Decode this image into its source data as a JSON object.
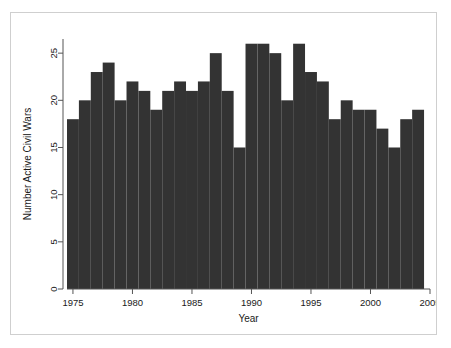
{
  "chart_data": {
    "type": "bar",
    "title": "",
    "subtitle": "",
    "xlabel": "Year",
    "ylabel": "Number Active Civil Wars",
    "categories": [
      1975,
      1976,
      1977,
      1978,
      1979,
      1980,
      1981,
      1982,
      1983,
      1984,
      1985,
      1986,
      1987,
      1988,
      1989,
      1990,
      1991,
      1992,
      1993,
      1994,
      1995,
      1996,
      1997,
      1998,
      1999,
      2000,
      2001,
      2002,
      2003,
      2004
    ],
    "values": [
      18,
      20,
      23,
      24,
      20,
      22,
      21,
      19,
      21,
      22,
      21,
      22,
      25,
      21,
      15,
      26,
      26,
      25,
      20,
      26,
      23,
      22,
      18,
      20,
      19,
      19,
      17,
      15,
      18,
      19
    ],
    "xlim": [
      1974.5,
      2005.0
    ],
    "ylim": [
      0,
      26.5
    ],
    "xticks": [
      1975,
      1980,
      1985,
      1990,
      1995,
      2000,
      2005
    ],
    "xtick_labels": [
      "1975",
      "1980",
      "1985",
      "1990",
      "1995",
      "2000",
      "2005"
    ],
    "yticks": [
      0,
      5,
      10,
      15,
      20,
      25
    ],
    "ytick_labels": [
      "0",
      "5",
      "10",
      "15",
      "20",
      "25"
    ],
    "grid": false,
    "legend": null,
    "bar_color": "#333333",
    "axis_color": "#555555",
    "bar_width_years": 1,
    "annotations": []
  },
  "figure": {
    "border_color": "#cfcfcf",
    "background": "#ffffff"
  }
}
